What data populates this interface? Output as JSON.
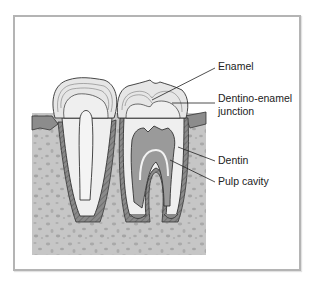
{
  "figure": {
    "labels": {
      "enamel": "Enamel",
      "dej_line1": "Dentino-enamel",
      "dej_line2": "junction",
      "dentin": "Dentin",
      "pulp": "Pulp cavity"
    },
    "colors": {
      "frame": "#b4b4b4",
      "bone": "#c4c4c4",
      "bone_speckle": "#a8a8a8",
      "gum": "#8c8c8c",
      "enamel": "#e8e8e8",
      "dentin": "#efefef",
      "pulp": "#9a9a9a",
      "cementum": "#7a7a7a",
      "outline": "#333333"
    }
  }
}
